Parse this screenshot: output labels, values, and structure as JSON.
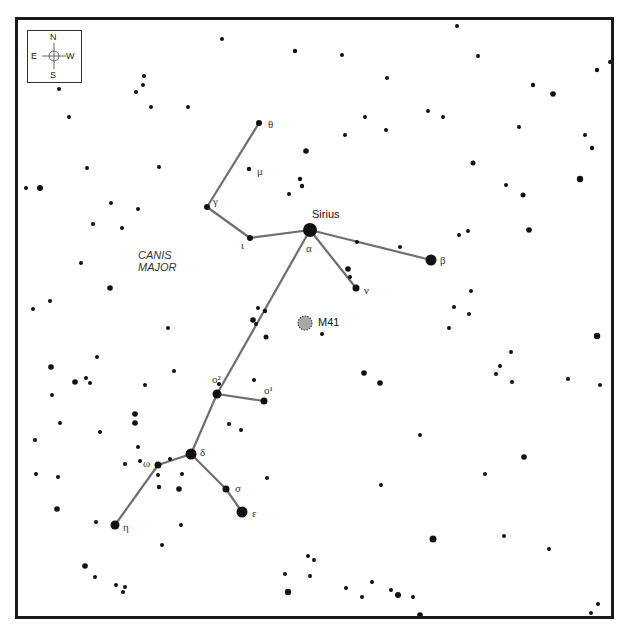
{
  "chart_data": {
    "type": "scatter",
    "constellation_label": [
      "CANIS",
      "MAJOR"
    ],
    "compass": {
      "north": "N",
      "south": "S",
      "east": "E",
      "west": "W"
    },
    "deep_sky_objects": [
      {
        "name": "M41",
        "x": 305,
        "y": 323,
        "r": 7,
        "fill": "#a8a8a8"
      }
    ],
    "named_stars": [
      {
        "id": "alpha",
        "greek": "α",
        "name": "Sirius",
        "x": 310,
        "y": 230,
        "r": 7
      },
      {
        "id": "beta",
        "greek": "β",
        "x": 431,
        "y": 260,
        "r": 5.5
      },
      {
        "id": "gamma",
        "greek": "γ",
        "x": 207,
        "y": 207,
        "r": 3
      },
      {
        "id": "theta",
        "greek": "θ",
        "x": 259,
        "y": 123,
        "r": 3
      },
      {
        "id": "mu",
        "greek": "μ",
        "x": 249,
        "y": 169,
        "r": 2.2
      },
      {
        "id": "iota",
        "greek": "ι",
        "x": 250,
        "y": 238,
        "r": 3
      },
      {
        "id": "nu",
        "greek": "ν",
        "x": 356,
        "y": 288,
        "r": 3.5
      },
      {
        "id": "omicron2",
        "greek": "ο²",
        "x": 217,
        "y": 394,
        "r": 4.5
      },
      {
        "id": "omicron1",
        "greek": "ο¹",
        "x": 264,
        "y": 401,
        "r": 3.5
      },
      {
        "id": "delta",
        "greek": "δ",
        "x": 191,
        "y": 454,
        "r": 5.5
      },
      {
        "id": "omega",
        "greek": "ω",
        "x": 158,
        "y": 465,
        "r": 3.5
      },
      {
        "id": "sigma",
        "greek": "σ",
        "x": 226,
        "y": 489,
        "r": 3.5
      },
      {
        "id": "epsilon",
        "greek": "ε",
        "x": 242,
        "y": 512,
        "r": 5.5
      },
      {
        "id": "eta",
        "greek": "η",
        "x": 115,
        "y": 525,
        "r": 4.5
      }
    ],
    "lines": [
      [
        "theta",
        "gamma"
      ],
      [
        "gamma",
        "iota"
      ],
      [
        "iota",
        "alpha"
      ],
      [
        "alpha",
        "beta"
      ],
      [
        "alpha",
        "nu"
      ],
      [
        "alpha",
        "omicron2"
      ],
      [
        "omicron2",
        "omicron1"
      ],
      [
        "omicron2",
        "delta"
      ],
      [
        "delta",
        "omega"
      ],
      [
        "omega",
        "eta"
      ],
      [
        "delta",
        "sigma"
      ],
      [
        "sigma",
        "epsilon"
      ]
    ],
    "background_stars": [
      [
        222,
        39,
        2
      ],
      [
        295,
        51,
        2.2
      ],
      [
        342,
        55,
        2
      ],
      [
        457,
        26,
        2
      ],
      [
        478,
        56,
        2
      ],
      [
        597,
        70,
        2.2
      ],
      [
        553,
        94,
        2.8
      ],
      [
        533,
        85,
        2.2
      ],
      [
        610,
        62,
        2
      ],
      [
        144,
        76,
        2
      ],
      [
        143,
        85,
        2
      ],
      [
        136,
        92,
        2
      ],
      [
        151,
        107,
        2
      ],
      [
        188,
        107,
        2
      ],
      [
        59,
        89,
        2
      ],
      [
        69,
        117,
        2
      ],
      [
        387,
        78,
        2
      ],
      [
        428,
        111,
        2
      ],
      [
        443,
        117,
        2
      ],
      [
        345,
        135,
        2
      ],
      [
        365,
        117,
        2
      ],
      [
        386,
        130,
        2
      ],
      [
        306,
        151,
        2.8
      ],
      [
        300,
        179,
        2.2
      ],
      [
        302,
        186,
        2.2
      ],
      [
        289,
        194,
        2
      ],
      [
        519,
        127,
        2
      ],
      [
        585,
        135,
        2
      ],
      [
        592,
        148,
        2.2
      ],
      [
        473,
        163,
        2.5
      ],
      [
        580,
        179,
        3.2
      ],
      [
        506,
        185,
        2
      ],
      [
        523,
        195,
        2.5
      ],
      [
        26,
        188,
        2
      ],
      [
        40,
        188,
        3
      ],
      [
        87,
        168,
        2
      ],
      [
        111,
        203,
        2
      ],
      [
        138,
        209,
        2
      ],
      [
        122,
        228,
        2
      ],
      [
        93,
        224,
        2
      ],
      [
        159,
        167,
        2
      ],
      [
        81,
        263,
        2
      ],
      [
        110,
        288,
        2.8
      ],
      [
        50,
        301,
        2
      ],
      [
        33,
        309,
        2
      ],
      [
        168,
        328,
        2
      ],
      [
        97,
        357,
        2
      ],
      [
        51,
        367,
        2.8
      ],
      [
        75,
        382,
        2.8
      ],
      [
        86,
        378,
        2
      ],
      [
        90,
        383,
        2
      ],
      [
        145,
        385,
        2
      ],
      [
        174,
        371,
        2
      ],
      [
        52,
        395,
        2
      ],
      [
        60,
        423,
        2
      ],
      [
        135,
        414,
        2.8
      ],
      [
        135,
        423,
        2.8
      ],
      [
        100,
        432,
        2
      ],
      [
        125,
        464,
        2
      ],
      [
        140,
        461,
        2
      ],
      [
        35,
        440,
        2
      ],
      [
        138,
        447,
        2
      ],
      [
        36,
        474,
        2
      ],
      [
        58,
        477,
        2
      ],
      [
        57,
        509,
        2.8
      ],
      [
        96,
        522,
        2
      ],
      [
        162,
        545,
        2
      ],
      [
        159,
        487,
        2.2
      ],
      [
        170,
        459,
        2
      ],
      [
        158,
        475,
        2
      ],
      [
        179,
        489,
        2.8
      ],
      [
        181,
        525,
        2
      ],
      [
        85,
        566,
        2.8
      ],
      [
        95,
        577,
        2
      ],
      [
        116,
        585,
        2
      ],
      [
        125,
        587,
        2
      ],
      [
        123,
        592,
        2
      ],
      [
        258,
        308,
        2
      ],
      [
        253,
        320,
        2.8
      ],
      [
        265,
        311,
        2.2
      ],
      [
        256,
        324,
        2
      ],
      [
        266,
        337,
        2.5
      ],
      [
        254,
        380,
        2
      ],
      [
        219,
        384,
        2
      ],
      [
        229,
        424,
        2
      ],
      [
        241,
        430,
        2
      ],
      [
        267,
        478,
        2
      ],
      [
        182,
        474,
        2
      ],
      [
        322,
        334,
        2
      ],
      [
        348,
        269,
        2.8
      ],
      [
        350,
        277,
        2
      ],
      [
        357,
        242,
        2
      ],
      [
        400,
        247,
        2
      ],
      [
        459,
        235,
        2
      ],
      [
        468,
        231,
        2
      ],
      [
        529,
        230,
        2.8
      ],
      [
        471,
        291,
        2
      ],
      [
        454,
        307,
        2
      ],
      [
        469,
        314,
        2
      ],
      [
        449,
        328,
        2
      ],
      [
        511,
        352,
        2
      ],
      [
        500,
        366,
        2
      ],
      [
        496,
        374,
        2
      ],
      [
        512,
        382,
        2
      ],
      [
        568,
        379,
        2
      ],
      [
        600,
        385,
        2
      ],
      [
        597,
        336,
        3.2
      ],
      [
        364,
        373,
        2.8
      ],
      [
        380,
        383,
        2.8
      ],
      [
        420,
        435,
        2
      ],
      [
        524,
        457,
        2.8
      ],
      [
        485,
        474,
        2
      ],
      [
        381,
        485,
        2
      ],
      [
        433,
        539,
        3.5
      ],
      [
        504,
        536,
        2
      ],
      [
        549,
        549,
        2
      ],
      [
        285,
        574,
        2
      ],
      [
        308,
        556,
        2
      ],
      [
        314,
        560,
        2
      ],
      [
        310,
        576,
        2
      ],
      [
        288,
        592,
        3.2
      ],
      [
        346,
        588,
        2
      ],
      [
        372,
        582,
        2
      ],
      [
        362,
        597,
        2
      ],
      [
        391,
        590,
        2
      ],
      [
        413,
        597,
        2
      ],
      [
        398,
        595,
        3
      ],
      [
        420,
        615,
        2.8
      ],
      [
        598,
        604,
        2
      ],
      [
        591,
        613,
        2
      ],
      [
        612,
        61,
        2
      ]
    ]
  }
}
